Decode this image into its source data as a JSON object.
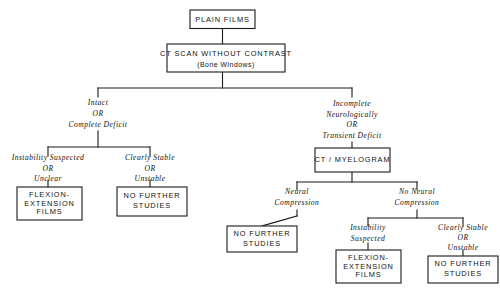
{
  "diagram": {
    "line_color": "#1a1a1a",
    "text_color": "#111111",
    "background_color": "#ffffff",
    "nodes": {
      "plain_films": {
        "line1": "PLAIN FILMS"
      },
      "ct_scan": {
        "line1": "CT SCAN WITHOUT CONTRAST",
        "line2": "(Bone Windows)"
      },
      "ct_myelogram": {
        "line1": "CT / MYELOGRAM"
      },
      "flexion_left": {
        "line1": "FLEXION-",
        "line2": "EXTENSION",
        "line3": "FILMS"
      },
      "no_further_left": {
        "line1": "NO FURTHER",
        "line2": "STUDIES"
      },
      "no_further_mid": {
        "line1": "NO FURTHER",
        "line2": "STUDIES"
      },
      "flexion_right": {
        "line1": "FLEXION-",
        "line2": "EXTENSION",
        "line3": "FILMS"
      },
      "no_further_right": {
        "line1": "NO FURTHER",
        "line2": "STUDIES"
      }
    },
    "branch_labels": {
      "intact": {
        "line1": "Intact",
        "line2": "OR",
        "line3": "Complete Deficit"
      },
      "incomplete": {
        "line1": "Incomplete",
        "line2": "Neurologically",
        "line3": "OR",
        "line4": "Transient Deficit"
      },
      "instability_unclear": {
        "line1": "Instability Suspected",
        "line2": "OR",
        "line3": "Unclear"
      },
      "clearly_stable_left": {
        "line1": "Clearly Stable",
        "line2": "OR",
        "line3": "Unstable"
      },
      "neural_compression": {
        "line1": "Neural",
        "line2": "Compression"
      },
      "no_neural_compression": {
        "line1": "No Neural",
        "line2": "Compression"
      },
      "instability_suspected": {
        "line1": "Instability",
        "line2": "Suspected"
      },
      "clearly_stable_right": {
        "line1": "Clearly Stable",
        "line2": "OR",
        "line3": "Unstable"
      }
    }
  }
}
